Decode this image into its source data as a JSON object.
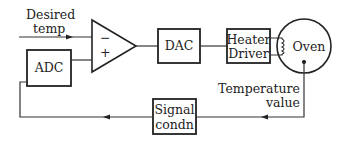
{
  "diagram": {
    "input_label": [
      "Desired",
      "temp"
    ],
    "comparator": {
      "minus": "−",
      "plus": "+"
    },
    "blocks": {
      "adc": "ADC",
      "dac": "DAC",
      "heater_driver": [
        "Heater",
        "Driver"
      ],
      "oven": "Oven",
      "signal_condn": [
        "Signal",
        "condn"
      ]
    },
    "feedback_label": [
      "Temperature",
      "value"
    ]
  }
}
